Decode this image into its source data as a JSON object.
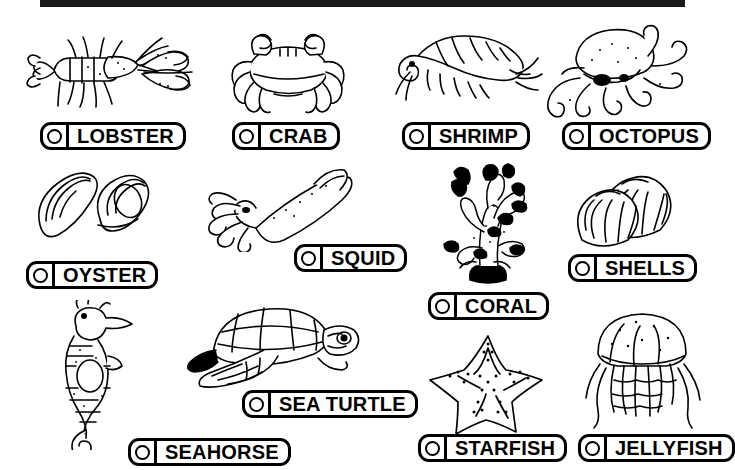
{
  "page": {
    "top_band_color": "#1a1a1a",
    "background_color": "#ffffff",
    "ink_color": "#000000",
    "columns": 4,
    "rows": 3
  },
  "checkbox": {
    "icon": "circle-checkbox-icon",
    "state": "unchecked"
  },
  "items": [
    {
      "id": "lobster",
      "label": "LOBSTER",
      "icon": "lobster-illustration",
      "row": 1,
      "col": 1
    },
    {
      "id": "crab",
      "label": "CRAB",
      "icon": "crab-illustration",
      "row": 1,
      "col": 2
    },
    {
      "id": "shrimp",
      "label": "SHRIMP",
      "icon": "shrimp-illustration",
      "row": 1,
      "col": 3
    },
    {
      "id": "octopus",
      "label": "OCTOPUS",
      "icon": "octopus-illustration",
      "row": 1,
      "col": 4
    },
    {
      "id": "oyster",
      "label": "OYSTER",
      "icon": "oyster-illustration",
      "row": 2,
      "col": 1
    },
    {
      "id": "squid",
      "label": "SQUID",
      "icon": "squid-illustration",
      "row": 2,
      "col": 2
    },
    {
      "id": "coral",
      "label": "CORAL",
      "icon": "coral-illustration",
      "row": 2,
      "col": 3
    },
    {
      "id": "shells",
      "label": "SHELLS",
      "icon": "shells-illustration",
      "row": 2,
      "col": 4
    },
    {
      "id": "seahorse",
      "label": "SEAHORSE",
      "icon": "seahorse-illustration",
      "row": 3,
      "col": 1
    },
    {
      "id": "seaturtle",
      "label": "SEA TURTLE",
      "icon": "sea-turtle-illustration",
      "row": 3,
      "col": 2
    },
    {
      "id": "starfish",
      "label": "STARFISH",
      "icon": "starfish-illustration",
      "row": 3,
      "col": 3
    },
    {
      "id": "jellyfish",
      "label": "JELLYFISH",
      "icon": "jellyfish-illustration",
      "row": 3,
      "col": 4
    }
  ]
}
